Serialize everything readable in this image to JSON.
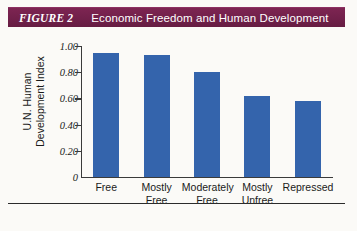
{
  "header": {
    "figure_tag": "FIGURE 2",
    "caption": "Economic Freedom and Human Development",
    "bar_color": "#71204a",
    "text_color": "#ffffff"
  },
  "chart_data": {
    "type": "bar",
    "title": "Economic Freedom and Human Development",
    "xlabel": "",
    "ylabel": "U.N. Human Development Index",
    "ylabel_line1": "U.N. Human",
    "ylabel_line2": "Development Index",
    "categories": [
      "Free",
      "Mostly Free",
      "Moderately Free",
      "Mostly Unfree",
      "Repressed"
    ],
    "category_lines": [
      [
        "Free"
      ],
      [
        "Mostly",
        "Free"
      ],
      [
        "Moderately",
        "Free"
      ],
      [
        "Mostly",
        "Unfree"
      ],
      [
        "Repressed"
      ]
    ],
    "values": [
      0.95,
      0.93,
      0.8,
      0.62,
      0.58
    ],
    "ylim": [
      0,
      1.0
    ],
    "yticks": [
      1.0,
      0.8,
      0.6,
      0.4,
      0.2,
      0
    ],
    "ytick_labels": [
      "1.00",
      "0.80",
      "0.60",
      "0.40",
      "0.20",
      "0"
    ],
    "grid": false,
    "legend": "none",
    "series_color": "#3464ac"
  }
}
